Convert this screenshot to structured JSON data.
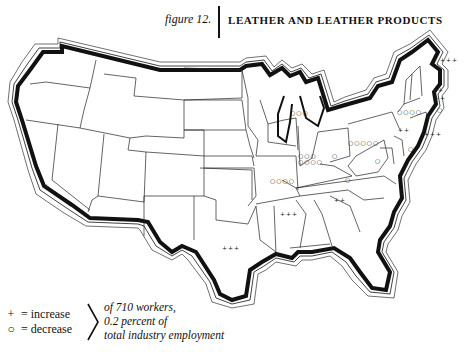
{
  "figure": {
    "label": "figure 12.",
    "title": "LEATHER AND LEATHER PRODUCTS"
  },
  "legend": {
    "increase_symbol": "+",
    "increase_label": "= increase",
    "decrease_symbol": "○",
    "decrease_label": "= decrease",
    "note_line1": "of 710 workers,",
    "note_line2": "0.2 percent of",
    "note_line3": "total industry employment"
  },
  "markers": {
    "california": "+",
    "texas": "+++",
    "arkansas": "+++",
    "tennessee": "++",
    "wisconsin": "○○○",
    "illinois_row1": "○○○",
    "illinois_row2": "○○○○",
    "missouri": "○○○○",
    "indiana": "○",
    "ohio": "○○○○○",
    "kentucky": "○",
    "west_virginia": "○",
    "new_york": "○○○○",
    "pennsylvania": "++",
    "new_jersey": "+++",
    "maryland": "○",
    "maine": "+++",
    "new_hampshire": "++",
    "massachusetts": "++",
    "connecticut": "○"
  },
  "colors": {
    "ink": "#111111",
    "background": "#ffffff"
  }
}
